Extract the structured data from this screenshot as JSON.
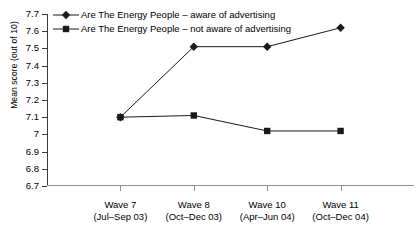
{
  "chart_data": {
    "type": "line",
    "title": "",
    "xlabel": "",
    "ylabel": "Mean score (out of 10)",
    "ylim": [
      6.7,
      7.7
    ],
    "ytick_step": 0.1,
    "yticks": [
      "7.7",
      "7.6",
      "7.5",
      "7.4",
      "7.3",
      "7.2",
      "7.1",
      "7",
      "6.9",
      "6.8",
      "6.7"
    ],
    "ytick_values": [
      7.7,
      7.6,
      7.5,
      7.4,
      7.3,
      7.2,
      7.1,
      7.0,
      6.9,
      6.8,
      6.7
    ],
    "grid": false,
    "legend_position": "top-left-inside",
    "categories": [
      "Wave 7",
      "Wave 8",
      "Wave 10",
      "Wave 11"
    ],
    "category_sublabels": [
      "(Jul–Sep 03)",
      "(Oct–Dec 03)",
      "(Apr–Jun 04)",
      "(Oct–Dec 04)"
    ],
    "series": [
      {
        "name": "Are The Energy People – aware of advertising",
        "marker": "diamond",
        "color": "#1a1a1a",
        "values": [
          7.1,
          7.51,
          7.51,
          7.62
        ]
      },
      {
        "name": "Are The Energy People – not aware of advertising",
        "marker": "square",
        "color": "#1a1a1a",
        "values": [
          7.1,
          7.11,
          7.02,
          7.02
        ]
      }
    ]
  },
  "legend": {
    "items": [
      {
        "label": "Are The Energy People – aware of advertising",
        "marker": "diamond-marker-icon"
      },
      {
        "label": "Are The Energy People – not aware of advertising",
        "marker": "square-marker-icon"
      }
    ]
  },
  "axes": {
    "y_title": "Mean score (out of 10)"
  }
}
